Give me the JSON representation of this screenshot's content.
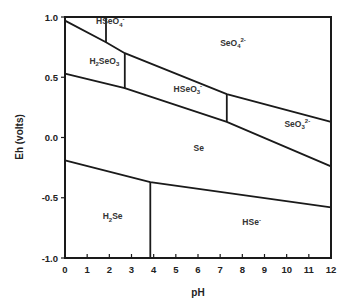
{
  "chart_data": {
    "type": "line",
    "title": "",
    "xlabel": "pH",
    "ylabel": "Eh (volts)",
    "xlim": [
      0,
      12
    ],
    "ylim": [
      -1.0,
      1.0
    ],
    "x_ticks": [
      "0",
      "1",
      "2",
      "3",
      "4",
      "5",
      "6",
      "7",
      "8",
      "9",
      "10",
      "11",
      "12"
    ],
    "y_ticks": [
      "1.0",
      "0.5",
      "0.0",
      "-0.5",
      "-1.0"
    ],
    "y_tick_values": [
      1.0,
      0.5,
      0.0,
      -0.5,
      -1.0
    ],
    "grid": false,
    "legend": null,
    "series": [
      {
        "name": "upper-oxidized-boundary",
        "points": [
          [
            0,
            0.97
          ],
          [
            1.85,
            0.79
          ],
          [
            2.7,
            0.7
          ],
          [
            7.3,
            0.36
          ],
          [
            12,
            0.13
          ]
        ]
      },
      {
        "name": "selenium-upper-boundary",
        "points": [
          [
            0,
            0.53
          ],
          [
            2.7,
            0.41
          ],
          [
            7.3,
            0.13
          ],
          [
            12,
            -0.24
          ]
        ]
      },
      {
        "name": "selenium-lower-boundary",
        "points": [
          [
            0,
            -0.19
          ],
          [
            3.85,
            -0.37
          ],
          [
            12,
            -0.58
          ]
        ]
      },
      {
        "name": "HSeO4-/SeO4 vertical",
        "points": [
          [
            1.85,
            1.0
          ],
          [
            1.85,
            0.79
          ]
        ]
      },
      {
        "name": "H2SeO3/HSeO3- vertical",
        "points": [
          [
            2.7,
            0.7
          ],
          [
            2.7,
            0.41
          ]
        ]
      },
      {
        "name": "HSeO3-/SeO3 2- vertical",
        "points": [
          [
            7.3,
            0.36
          ],
          [
            7.3,
            0.13
          ]
        ]
      },
      {
        "name": "H2Se/HSe- vertical",
        "points": [
          [
            3.85,
            -0.37
          ],
          [
            3.85,
            -1.0
          ]
        ]
      }
    ],
    "regions": [
      {
        "id": "hseo4",
        "label": "HSeO4-",
        "base": "HSeO",
        "sub": "4",
        "sup": "-",
        "pH": 1.4,
        "Eh": 0.94
      },
      {
        "id": "seo4",
        "label": "SeO4 2-",
        "base": "SeO",
        "sub": "4",
        "sup": "2-",
        "pH": 7.0,
        "Eh": 0.76
      },
      {
        "id": "h2seo3",
        "label": "H2SeO3",
        "base": "H",
        "sub": "2",
        "rest": "SeO",
        "sub2": "3",
        "pH": 1.1,
        "Eh": 0.61
      },
      {
        "id": "hseo3",
        "label": "HSeO3-",
        "base": "HSeO",
        "sub": "3",
        "sup": "-",
        "pH": 4.9,
        "Eh": 0.38
      },
      {
        "id": "seo3",
        "label": "SeO3 2-",
        "base": "SeO",
        "sub": "3",
        "sup": "2-",
        "pH": 9.9,
        "Eh": 0.09
      },
      {
        "id": "se",
        "label": "Se",
        "base": "Se",
        "pH": 5.8,
        "Eh": -0.11
      },
      {
        "id": "h2se",
        "label": "H2Se",
        "base": "H",
        "sub": "2",
        "rest": "Se",
        "pH": 1.7,
        "Eh": -0.68
      },
      {
        "id": "hse",
        "label": "HSe-",
        "base": "HSe",
        "sup": "-",
        "pH": 8.0,
        "Eh": -0.73
      }
    ],
    "colors": {
      "line": "#1a1a1a",
      "text": "#222222",
      "background": "#ffffff"
    }
  }
}
